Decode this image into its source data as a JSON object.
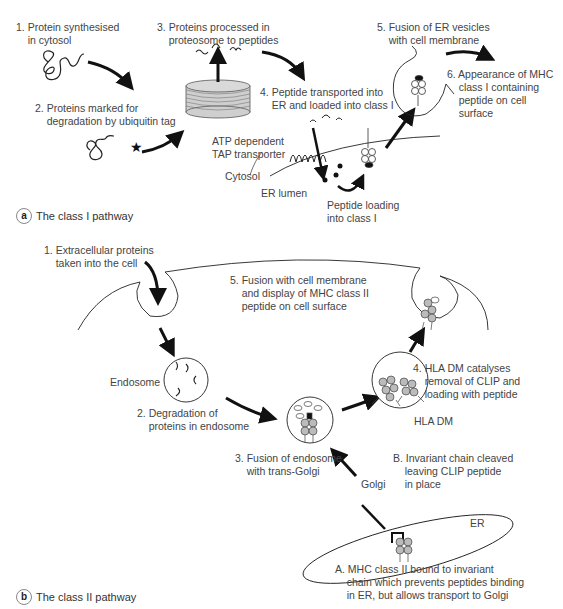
{
  "panel_a": {
    "badge": "a",
    "title": "The class I pathway",
    "steps": {
      "s1": "1. Protein synthesised\n    in cytosol",
      "s2": "2. Proteins marked for\n    degradation by ubiquitin tag",
      "s3": "3. Proteins processed in\n    proteosome to peptides",
      "s4": "4. Peptide transported into\n    ER and loaded into class I",
      "s5": "5. Fusion of ER vesicles\n    with cell membrane",
      "s6": "6. Appearance of MHC\n    class I containing\n    peptide on cell\n    surface"
    },
    "labels": {
      "tap": "ATP dependent\nTAP transporter",
      "cytosol": "Cytosol",
      "er_lumen": "ER lumen",
      "peptide_loading": "Peptide loading\ninto class I"
    }
  },
  "panel_b": {
    "badge": "b",
    "title": "The class II pathway",
    "steps": {
      "s1": "1. Extracellular proteins\n    taken into the cell",
      "s2": "2. Degradation of\n    proteins in endosome",
      "s3": "3. Fusion of endosome\n    with trans-Golgi",
      "s4": "4. HLA DM catalyses\n    removal of CLIP and\n    loading with peptide",
      "s5": "5. Fusion with cell membrane\n    and display of MHC class II\n    peptide on cell surface",
      "sA": "A. MHC class II bound to invariant\n    chain which prevents peptides binding\n    in ER, but allows transport to Golgi",
      "sB": "B. Invariant chain cleaved\n    leaving CLIP peptide\n    in place"
    },
    "labels": {
      "endosome": "Endosome",
      "hla_dm": "HLA DM",
      "golgi": "Golgi",
      "er": "ER"
    }
  }
}
